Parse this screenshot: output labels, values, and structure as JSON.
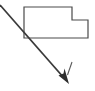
{
  "canvas": {
    "width": 95,
    "height": 91,
    "background_color": "#ffffff"
  },
  "diagram": {
    "title": "L-shaped part with direction arrow",
    "stroke_color": "#4a4a4a",
    "arrow_color": "#3a3a3a",
    "tick_color": "#5a5a5a",
    "shape": {
      "name": "l-shaped-polygon",
      "description": "Rectangle with a rectangular notch removed from the top-right corner",
      "fill": "none",
      "stroke_width": 1.2,
      "points": "24,7 72,7 72,20 88,20 88,38 24,38",
      "vertices": [
        {
          "x": 24,
          "y": 7
        },
        {
          "x": 72,
          "y": 7
        },
        {
          "x": 72,
          "y": 20
        },
        {
          "x": 88,
          "y": 20
        },
        {
          "x": 88,
          "y": 38
        },
        {
          "x": 24,
          "y": 38
        }
      ]
    },
    "arrow": {
      "name": "direction-arrow",
      "start": {
        "x": 0,
        "y": 5
      },
      "end": {
        "x": 69,
        "y": 84
      },
      "shaft_width": 1.8,
      "head_length": 11,
      "head_width": 7,
      "head_points": "69,84 60.5,74.5 64,73 65.5,70.5"
    },
    "tick": {
      "name": "arrow-length-tick",
      "label": "l",
      "x1": 72,
      "y1": 62,
      "x2": 68,
      "y2": 75,
      "stroke_width": 1.1
    }
  }
}
